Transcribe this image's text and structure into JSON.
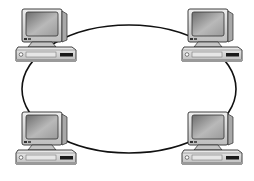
{
  "diagram": {
    "type": "ring-network-topology",
    "background": "#ffffff",
    "ring": {
      "cx": 129,
      "cy": 89,
      "rx": 107,
      "ry": 64,
      "stroke": "#111111",
      "stroke_width": 1.6
    },
    "nodes": [
      {
        "id": "pc-top-left",
        "kind": "desktop-computer",
        "x": 12,
        "y": 7
      },
      {
        "id": "pc-top-right",
        "kind": "desktop-computer",
        "x": 178,
        "y": 7
      },
      {
        "id": "pc-bottom-left",
        "kind": "desktop-computer",
        "x": 12,
        "y": 110
      },
      {
        "id": "pc-bottom-right",
        "kind": "desktop-computer",
        "x": 178,
        "y": 110
      }
    ],
    "colors": {
      "case": "#d9d9d9",
      "case_shadow": "#9a9a9a",
      "screen": "#8c8c8c",
      "screen_highlight": "#c8c8c8",
      "outline": "#2a2a2a",
      "drive": "#1a1a1a"
    }
  }
}
